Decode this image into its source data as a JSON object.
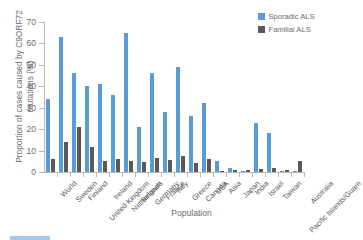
{
  "chart_data": {
    "type": "bar",
    "title": "",
    "xlabel": "Population",
    "ylabel": "Proportion of cases caused by C9ORF72 mutations (%)",
    "ylim": [
      0,
      70
    ],
    "yticks": [
      0,
      10,
      20,
      30,
      40,
      50,
      60,
      70
    ],
    "grid": false,
    "legend_position": "top-right",
    "categories": [
      "World",
      "Sweden",
      "Finland",
      "United Kingdom",
      "Ireland",
      "Netherlands",
      "Belgium",
      "Germany",
      "France",
      "Italy",
      "Greece",
      "Canada",
      "USA",
      "Asia",
      "Japan",
      "India",
      "Israel",
      "Taiwan",
      "Pacific Islands/Guam",
      "Australia"
    ],
    "series": [
      {
        "name": "Sporadic ALS",
        "color": "#5B9BD5",
        "values": [
          34,
          63,
          46,
          40,
          41,
          36,
          65,
          21,
          46,
          28,
          49,
          26,
          32,
          5,
          2,
          0.5,
          23,
          18,
          0.5,
          0.7
        ]
      },
      {
        "name": "Familial ALS",
        "color": "#595959",
        "values": [
          6,
          14,
          21,
          11.5,
          5,
          6,
          5,
          4.5,
          6.5,
          5.5,
          7.5,
          4,
          6,
          0.7,
          1,
          1,
          1.2,
          2,
          1,
          5
        ]
      }
    ]
  },
  "legend": {
    "items": [
      {
        "label": "Sporadic ALS",
        "color": "#5B9BD5"
      },
      {
        "label": "Familial ALS",
        "color": "#595959"
      }
    ]
  },
  "axes": {
    "y_title": "Proportion of cases caused by C9ORF72 mutations (%)",
    "x_title": "Population"
  },
  "footer": {
    "text": ""
  }
}
